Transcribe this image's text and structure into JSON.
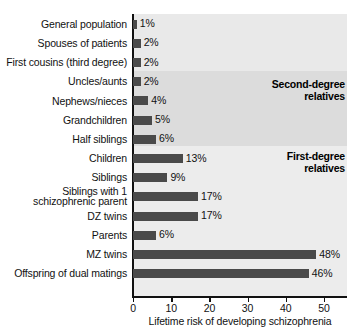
{
  "chart_data": {
    "type": "bar",
    "orientation": "horizontal",
    "title": "",
    "xlabel": "Lifetime risk of developing schizophrenia",
    "ylabel": "",
    "xlim": [
      0,
      57
    ],
    "xticks": [
      0,
      10,
      20,
      30,
      40,
      50
    ],
    "xtick_labels": [
      "0",
      "10",
      "20",
      "30",
      "40",
      "50"
    ],
    "grid": false,
    "legend": "none",
    "value_suffix": "%",
    "categories": [
      "General population",
      "Spouses of patients",
      "First cousins (third degree)",
      "Uncles/aunts",
      "Nephews/nieces",
      "Grandchildren",
      "Half siblings",
      "Children",
      "Siblings",
      "Siblings with 1 schizophrenic parent",
      "DZ twins",
      "Parents",
      "MZ twins",
      "Offspring of dual matings"
    ],
    "values": [
      1,
      2,
      2,
      2,
      4,
      5,
      6,
      13,
      9,
      17,
      17,
      6,
      48,
      46
    ],
    "value_labels": [
      "1%",
      "2%",
      "2%",
      "2%",
      "4%",
      "5%",
      "6%",
      "13%",
      "9%",
      "17%",
      "17%",
      "6%",
      "48%",
      "46%"
    ],
    "annotations": [
      {
        "text_line1": "Second-degree",
        "text_line2": "relatives"
      },
      {
        "text_line1": "First-degree",
        "text_line2": "relatives"
      }
    ],
    "colors": {
      "bar": "#4a4a4a",
      "plot_background": "#e9e9e9",
      "band_second_degree": "#dcdcdc",
      "band_first_degree": "#ececec",
      "axis": "#111111",
      "text": "#111111"
    }
  },
  "rows": [
    {
      "label": "General population",
      "label2": "",
      "value_label": "1%"
    },
    {
      "label": "Spouses of patients",
      "label2": "",
      "value_label": "2%"
    },
    {
      "label": "First cousins (third degree)",
      "label2": "",
      "value_label": "2%"
    },
    {
      "label": "Uncles/aunts",
      "label2": "",
      "value_label": "2%"
    },
    {
      "label": "Nephews/nieces",
      "label2": "",
      "value_label": "4%"
    },
    {
      "label": "Grandchildren",
      "label2": "",
      "value_label": "5%"
    },
    {
      "label": "Half siblings",
      "label2": "",
      "value_label": "6%"
    },
    {
      "label": "Children",
      "label2": "",
      "value_label": "13%"
    },
    {
      "label": "Siblings",
      "label2": "",
      "value_label": "9%"
    },
    {
      "label": "Siblings with 1",
      "label2": "schizophrenic parent",
      "value_label": "17%"
    },
    {
      "label": "DZ twins",
      "label2": "",
      "value_label": "17%"
    },
    {
      "label": "Parents",
      "label2": "",
      "value_label": "6%"
    },
    {
      "label": "MZ twins",
      "label2": "",
      "value_label": "48%"
    },
    {
      "label": "Offspring of dual matings",
      "label2": "",
      "value_label": "46%"
    }
  ],
  "annotations": {
    "second_degree_line1": "Second-degree",
    "second_degree_line2": "relatives",
    "first_degree_line1": "First-degree",
    "first_degree_line2": "relatives"
  },
  "axis": {
    "tick_0": "0",
    "tick_10": "10",
    "tick_20": "20",
    "tick_30": "30",
    "tick_40": "40",
    "tick_50": "50",
    "title": "Lifetime risk of developing schizophrenia"
  }
}
